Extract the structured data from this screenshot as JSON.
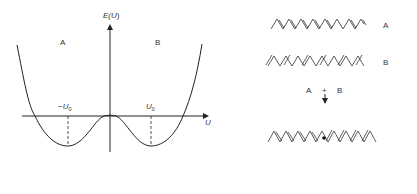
{
  "potential_plot": {
    "y_axis_label": "E(U)",
    "y_axis_label_main": "E(",
    "y_axis_label_var": "U",
    "y_axis_label_close": ")",
    "x_axis_label": "U",
    "region_left": "A",
    "region_right": "B",
    "min_left_label_sign": "−",
    "min_left_label": "U",
    "min_left_subscript": "0",
    "min_right_label": "U",
    "min_right_subscript": "0"
  },
  "chains": {
    "chain_a_label": "A",
    "chain_b_label": "B",
    "combine_left": "A",
    "combine_plus": "+",
    "combine_right": "B"
  },
  "colors": {
    "line": "#222222",
    "background": "#ffffff"
  }
}
